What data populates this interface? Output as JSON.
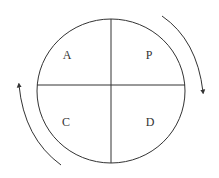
{
  "diagram": {
    "type": "PDCA cycle",
    "quadrants": [
      {
        "position": "top-left",
        "label": "A"
      },
      {
        "position": "top-right",
        "label": "P"
      },
      {
        "position": "bottom-left",
        "label": "C"
      },
      {
        "position": "bottom-right",
        "label": "D"
      }
    ],
    "arrows": [
      {
        "side": "right",
        "direction": "clockwise-down"
      },
      {
        "side": "left",
        "direction": "clockwise-up"
      }
    ],
    "stroke_color": "#333333"
  }
}
